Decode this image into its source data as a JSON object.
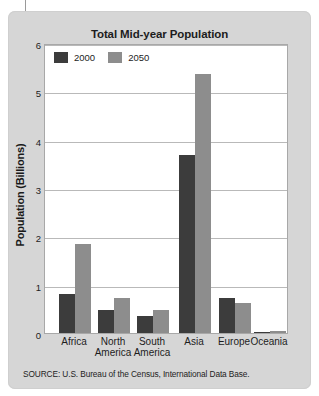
{
  "figure": {
    "title": "Total Mid-year Population",
    "source_note": "SOURCE: U.S. Bureau of the Census, International Data Base.",
    "card_background": "#d6d6d6",
    "plot_background": "#ffffff"
  },
  "legend": {
    "position": "top-left-inside",
    "items": [
      {
        "label": "2000",
        "color": "#3c3c3c",
        "swatch_name": "legend-swatch-2000"
      },
      {
        "label": "2050",
        "color": "#8d8d8d",
        "swatch_name": "legend-swatch-2050"
      }
    ]
  },
  "chart_data": {
    "type": "bar",
    "title": "Total Mid-year Population",
    "xlabel": "",
    "ylabel": "Population (Billions)",
    "ylim": [
      0,
      6
    ],
    "yticks": [
      0,
      1,
      2,
      3,
      4,
      5,
      6
    ],
    "ytick_labels": [
      "0",
      "1",
      "2",
      "3",
      "4",
      "5",
      "6"
    ],
    "grid": true,
    "grid_axis": "y",
    "legend_position": "upper left",
    "categories": [
      "Africa",
      "North America",
      "South America",
      "Asia",
      "Europe",
      "Oceania"
    ],
    "category_lines": [
      [
        "Africa",
        ""
      ],
      [
        "North",
        "America"
      ],
      [
        "South",
        "America"
      ],
      [
        "Asia",
        ""
      ],
      [
        "Europe",
        ""
      ],
      [
        "Oceania",
        ""
      ]
    ],
    "series": [
      {
        "name": "2000",
        "color": "#3c3c3c",
        "values": [
          0.8,
          0.48,
          0.35,
          3.68,
          0.73,
          0.03
        ]
      },
      {
        "name": "2050",
        "color": "#8d8d8d",
        "values": [
          1.85,
          0.72,
          0.47,
          5.35,
          0.63,
          0.05
        ]
      }
    ],
    "source": "SOURCE: U.S. Bureau of the Census, International Data Base."
  }
}
